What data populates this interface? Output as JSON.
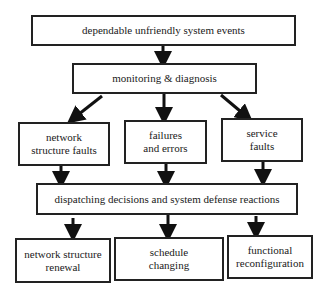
{
  "diagram": {
    "top": "dependable unfriendly system events",
    "monitor": "monitoring & diagnosis",
    "faults": [
      {
        "line1": "network",
        "line2": "structure faults"
      },
      {
        "line1": "failures",
        "line2": "and errors"
      },
      {
        "line1": "service",
        "line2": "faults"
      }
    ],
    "dispatch": "dispatching decisions and system defense reactions",
    "reactions": [
      {
        "line1": "network structure",
        "line2": "renewal"
      },
      {
        "line1": "schedule",
        "line2": "changing"
      },
      {
        "line1": "functional",
        "line2": "reconfiguration"
      }
    ]
  }
}
